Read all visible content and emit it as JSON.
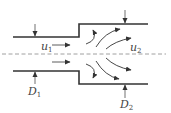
{
  "diagram": {
    "type": "sudden-expansion-pipe-flow",
    "colors": {
      "wall": "#333333",
      "arrow": "#333333",
      "centerline": "#888888",
      "background": "#ffffff"
    },
    "labels": {
      "u1": {
        "main": "u",
        "sub": "1"
      },
      "u2": {
        "main": "u",
        "sub": "2"
      },
      "D1": {
        "main": "D",
        "sub": "1"
      },
      "D2": {
        "main": "D",
        "sub": "2"
      }
    }
  }
}
